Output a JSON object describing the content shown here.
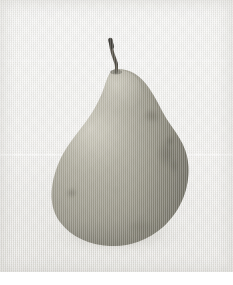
{
  "image": {
    "title": "Pear on light background",
    "subject": "pear",
    "medium": "photograph",
    "orientation": "portrait",
    "width_px": 233,
    "height_px": 285,
    "content_area": {
      "top": 0,
      "left": 0,
      "width": 233,
      "height": 272
    },
    "footer_strip": {
      "top": 272,
      "height": 13,
      "color": "#ffffff"
    }
  },
  "background": {
    "name": "paper-ground",
    "base_color": "#f0efec",
    "top_color": "#f2f2f0",
    "bottom_color": "#e8e7e3",
    "texture": "fine vertical scan lines",
    "seam_line_y": 154,
    "seam_color": "#ffffff"
  },
  "subject": {
    "name": "pear",
    "body_color": "#a9a697",
    "body_light": "#bdbaab",
    "body_mid": "#a29f90",
    "body_shadow": "#8b8879",
    "body_deep_shadow": "#6f6d61",
    "highlight_color": "#c9c6b8",
    "bounds": {
      "left": 52,
      "top": 68,
      "right": 190,
      "bottom": 246
    },
    "widest_y": 186,
    "neck_top_y": 70
  },
  "stem": {
    "name": "stem",
    "color": "#4a453c",
    "tip_color": "#32302a",
    "top": {
      "x": 112,
      "y": 40
    },
    "base": {
      "x": 116,
      "y": 72
    },
    "length_px": 32,
    "curve": "slight-s"
  },
  "blemishes": [
    {
      "name": "russet-patch-right-upper",
      "x": 152,
      "y": 116,
      "rx": 9,
      "ry": 7,
      "color": "#6e6b5d"
    },
    {
      "name": "russet-patch-right-mid",
      "x": 166,
      "y": 152,
      "rx": 11,
      "ry": 16,
      "color": "#5f5d52"
    },
    {
      "name": "dark-spot-right",
      "x": 170,
      "y": 142,
      "rx": 4,
      "ry": 6,
      "color": "#4d4b42"
    },
    {
      "name": "dark-spot-lower-left",
      "x": 72,
      "y": 193,
      "rx": 5,
      "ry": 4,
      "color": "#6c6a5d"
    },
    {
      "name": "speck-center",
      "x": 116,
      "y": 190,
      "rx": 2,
      "ry": 2,
      "color": "#8d8b7e"
    },
    {
      "name": "russet-bottom-right",
      "x": 140,
      "y": 226,
      "rx": 14,
      "ry": 7,
      "color": "#7d7b6e"
    }
  ],
  "shadow": {
    "name": "cast-shadow",
    "color": "#96948c",
    "center_x": 120,
    "center_y": 234,
    "width": 140,
    "height": 40
  }
}
